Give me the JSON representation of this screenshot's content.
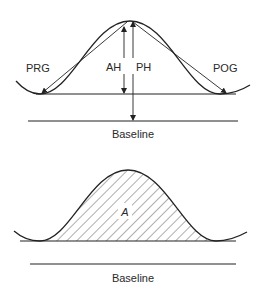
{
  "top_diagram": {
    "labels": {
      "prg": "PRG",
      "ah": "AH",
      "ph": "PH",
      "pog": "POG",
      "baseline": "Baseline"
    }
  },
  "bottom_diagram": {
    "labels": {
      "area": "A",
      "baseline": "Baseline"
    }
  },
  "colors": {
    "line": "#222222",
    "text": "#2a2a2a",
    "background": "#ffffff"
  }
}
